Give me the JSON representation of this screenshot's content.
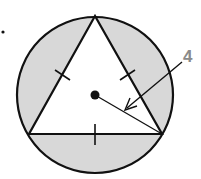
{
  "diagram": {
    "type": "geometry",
    "circle": {
      "cx": 95,
      "cy": 95,
      "r": 78,
      "fill": "#d8d8d8",
      "stroke": "#111111"
    },
    "triangle": {
      "vertices": [
        [
          95,
          16
        ],
        [
          29,
          134
        ],
        [
          162,
          134
        ]
      ],
      "fill": "#ffffff",
      "stroke": "#111111",
      "congruent_side_marks": 3
    },
    "center_dot": {
      "cx": 95,
      "cy": 95
    },
    "radius_label": "4",
    "label_color": "#8a8a8a",
    "bullet": "•"
  }
}
